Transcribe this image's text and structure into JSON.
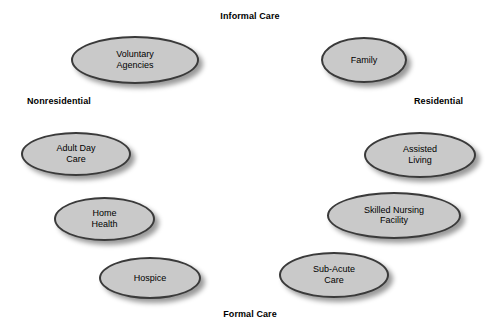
{
  "diagram": {
    "axis_labels": [
      {
        "id": "informal-care",
        "text": "Informal Care",
        "x": 250,
        "y": 11,
        "align": "center"
      },
      {
        "id": "nonresidential",
        "text": "Nonresidential",
        "x": 27,
        "y": 96,
        "align": "left"
      },
      {
        "id": "residential",
        "text": "Residential",
        "x": 414,
        "y": 96,
        "align": "left"
      },
      {
        "id": "formal-care",
        "text": "Formal Care",
        "x": 250,
        "y": 309,
        "align": "center"
      }
    ],
    "nodes": [
      {
        "id": "voluntary-agencies",
        "label": "Voluntary\nAgencies",
        "x": 71,
        "y": 36,
        "w": 128,
        "h": 48
      },
      {
        "id": "family",
        "label": "Family",
        "x": 321,
        "y": 37,
        "w": 86,
        "h": 46
      },
      {
        "id": "adult-day-care",
        "label": "Adult Day\nCare",
        "x": 21,
        "y": 132,
        "w": 110,
        "h": 44
      },
      {
        "id": "assisted-living",
        "label": "Assisted\nLiving",
        "x": 364,
        "y": 132,
        "w": 112,
        "h": 46
      },
      {
        "id": "home-health",
        "label": "Home\nHealth",
        "x": 54,
        "y": 197,
        "w": 101,
        "h": 44
      },
      {
        "id": "skilled-nursing-facility",
        "label": "Skilled Nursing\nFacility",
        "x": 327,
        "y": 192,
        "w": 134,
        "h": 47
      },
      {
        "id": "hospice",
        "label": "Hospice",
        "x": 99,
        "y": 257,
        "w": 102,
        "h": 42
      },
      {
        "id": "sub-acute-care",
        "label": "Sub-Acute\nCare",
        "x": 279,
        "y": 252,
        "w": 110,
        "h": 46
      }
    ],
    "colors": {
      "node_fill": "#c9c9c9",
      "node_border": "#3a3a3a",
      "text": "#000000",
      "background": "#ffffff"
    }
  }
}
